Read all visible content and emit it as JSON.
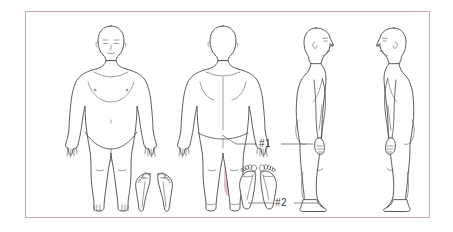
{
  "chart_type": "body-pain-map",
  "frame": {
    "border_color": "#c9a9b1",
    "background": "#ffffff"
  },
  "colors": {
    "outline": "#4a4a4a",
    "highlight": "#dba7ad",
    "highlight_soft": "#e7bfc4",
    "leader_line": "#555555",
    "label_text": "#3a3a3a",
    "frame_border": "#c9a9b1"
  },
  "figures": [
    {
      "id": "anterior",
      "name": "anterior-body-view",
      "orientation": "front"
    },
    {
      "id": "posterior",
      "name": "posterior-body-view",
      "orientation": "back"
    },
    {
      "id": "right-lateral",
      "name": "right-lateral-body-view",
      "orientation": "side-facing-right"
    },
    {
      "id": "left-lateral",
      "name": "left-lateral-body-view",
      "orientation": "side-facing-left"
    }
  ],
  "foot_views": [
    {
      "id": "dorsal",
      "name": "dorsal-foot-view",
      "label": ""
    },
    {
      "id": "plantar",
      "name": "plantar-foot-view",
      "label": ""
    }
  ],
  "annotations": [
    {
      "id": "pain-1",
      "label": "#1",
      "region": "posterior-lateral-thigh",
      "marker_type": "shaded-area",
      "color": "#dba7ad"
    },
    {
      "id": "pain-2",
      "label": "#2",
      "region": "plantar-heel",
      "marker_type": "dot",
      "color": "#dba7ad"
    }
  ]
}
